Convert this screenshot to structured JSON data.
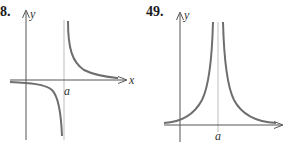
{
  "figures": [
    {
      "number": "8.",
      "axis_x_label": "x",
      "axis_y_label": "y",
      "asymptote_label": "a",
      "description": "Hyperbola-like graph with vertical asymptote at x = a; curve below x-axis left of a descending to -infinity, and above x-axis right of a decreasing toward 0"
    },
    {
      "number": "49.",
      "axis_y_label": "y",
      "asymptote_label": "a",
      "description": "Graph symmetric about vertical asymptote x = a, both branches rising to +infinity near a and approaching 0 far away"
    }
  ],
  "colors": {
    "curve": "#6e6e6e",
    "axis": "#555555",
    "asymptote": "#b8b8b8",
    "text": "#1a1a1a"
  }
}
